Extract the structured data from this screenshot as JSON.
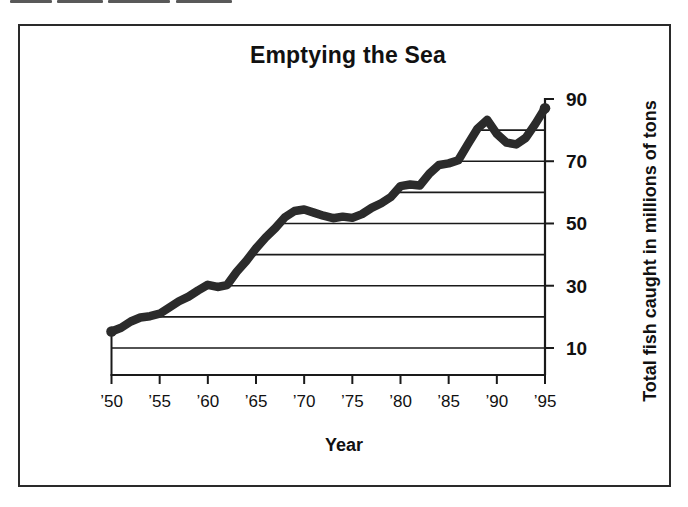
{
  "artifact": {
    "fragments": [
      {
        "x": 10,
        "w": 42
      },
      {
        "x": 57,
        "w": 46
      },
      {
        "x": 108,
        "w": 62
      },
      {
        "x": 176,
        "w": 56
      }
    ]
  },
  "chart_data": {
    "type": "line",
    "title": "Emptying the Sea",
    "xlabel": "Year",
    "ylabel": "Total fish caught in millions of tons",
    "x": [
      1950,
      1951,
      1952,
      1953,
      1954,
      1955,
      1956,
      1957,
      1958,
      1959,
      1960,
      1961,
      1962,
      1963,
      1964,
      1965,
      1966,
      1967,
      1968,
      1969,
      1970,
      1971,
      1972,
      1973,
      1974,
      1975,
      1976,
      1977,
      1978,
      1979,
      1980,
      1981,
      1982,
      1983,
      1984,
      1985,
      1986,
      1987,
      1988,
      1989,
      1990,
      1991,
      1992,
      1993,
      1994,
      1995
    ],
    "series": [
      {
        "name": "total-fish-caught-millions-of-tons",
        "values": [
          15.3,
          16.5,
          18.5,
          19.8,
          20.2,
          21,
          23,
          25,
          26.5,
          28.5,
          30.3,
          29.6,
          30.2,
          34.5,
          38,
          42,
          45.5,
          48.5,
          52,
          54,
          54.5,
          53.5,
          52.5,
          51.7,
          52.2,
          51.8,
          53,
          55,
          56.5,
          58.5,
          62,
          62.5,
          62.2,
          66,
          68.8,
          69.3,
          70.3,
          75.5,
          80.5,
          83.3,
          78.8,
          76,
          75.4,
          77.5,
          82,
          87
        ]
      }
    ],
    "x_tick_years": [
      1950,
      1955,
      1960,
      1965,
      1970,
      1975,
      1980,
      1985,
      1990,
      1995
    ],
    "x_tick_labels": [
      "’50",
      "’55",
      "’60",
      "’65",
      "’70",
      "’75",
      "’80",
      "’85",
      "’90",
      "’95"
    ],
    "y_tick_values": [
      10,
      30,
      50,
      70,
      90
    ],
    "y_tick_labels": [
      "10",
      "30",
      "50",
      "70",
      "90"
    ],
    "y_gridline_values": [
      10,
      20,
      30,
      40,
      50,
      60,
      70,
      80,
      90
    ],
    "xlim": [
      1950,
      1995
    ],
    "ylim": [
      0,
      93
    ],
    "grid": "horizontal-only; each line runs from the data line to the right-hand axis",
    "legend": "none",
    "y_axis_side": "right",
    "line_color": "#2b2b2b",
    "axis_color": "#1a1a1a",
    "endpoint_dots": true
  }
}
